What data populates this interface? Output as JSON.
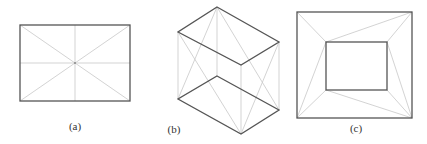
{
  "figure": {
    "colors": {
      "edge": "#555555",
      "guide": "#c8c8c8",
      "label": "#333333"
    },
    "panels": [
      {
        "id": "a",
        "label": "(a)",
        "description": "Rectangle with diagonals and midlines",
        "label_pos": [
          75,
          131
        ]
      },
      {
        "id": "b",
        "label": "(b)",
        "description": "Two parallelogram faces of a prism with connecting guide lines",
        "label_pos": [
          174,
          133
        ]
      },
      {
        "id": "c",
        "label": "(c)",
        "description": "Nested rectangles with connecting guide lines",
        "label_pos": [
          356,
          132
        ]
      }
    ]
  }
}
